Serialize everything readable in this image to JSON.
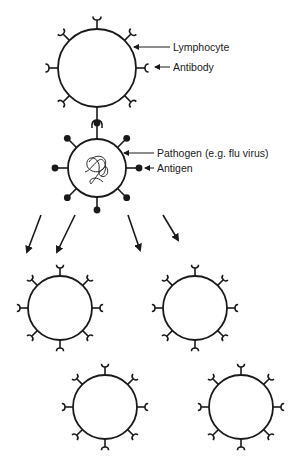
{
  "colors": {
    "stroke": "#1a1a1a",
    "background": "#ffffff"
  },
  "labels": {
    "lymphocyte": "Lymphocyte",
    "antibody": "Antibody",
    "pathogen": "Pathogen (e.g. flu virus)",
    "antigen": "Antigen"
  },
  "cells": {
    "lymphocyte": {
      "cx": 97,
      "cy": 68,
      "r": 39
    },
    "pathogen": {
      "cx": 97,
      "cy": 168,
      "r": 29
    },
    "clones": [
      {
        "cx": 60,
        "cy": 308,
        "r": 32
      },
      {
        "cx": 195,
        "cy": 308,
        "r": 32
      },
      {
        "cx": 105,
        "cy": 407,
        "r": 32
      },
      {
        "cx": 241,
        "cy": 407,
        "r": 32
      }
    ]
  },
  "arrows": [
    {
      "x1": 41,
      "y1": 215,
      "x2": 27,
      "y2": 252
    },
    {
      "x1": 75,
      "y1": 215,
      "x2": 57,
      "y2": 252
    },
    {
      "x1": 128,
      "y1": 215,
      "x2": 140,
      "y2": 250
    },
    {
      "x1": 163,
      "y1": 215,
      "x2": 178,
      "y2": 240
    }
  ]
}
